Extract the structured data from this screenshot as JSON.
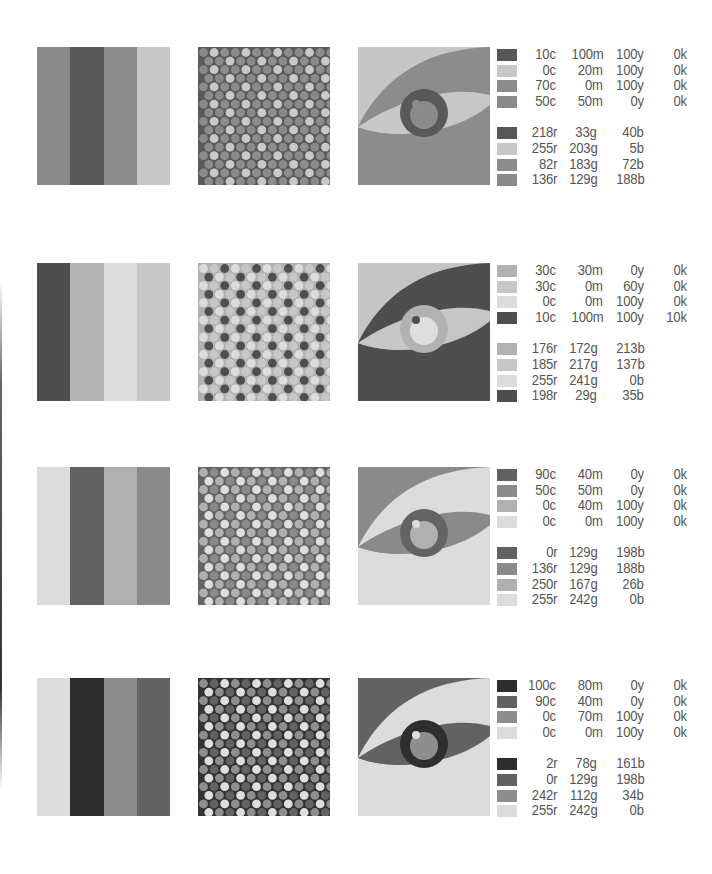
{
  "rows": [
    {
      "top": 47,
      "stripes": [
        "#8a8a8a",
        "#575757",
        "#8c8c8c",
        "#c8c8c8"
      ],
      "dots": {
        "bg": "#5a5a5a",
        "colors": [
          "#8a8a8a",
          "#c9c9c9",
          "#8d8d8d"
        ]
      },
      "eye": {
        "bg": "#c6c6c6",
        "lid": "#8c8c8c",
        "white": "#c8c8c8",
        "iris": "#595959",
        "pupil": "#8a8a8a",
        "highlight": "#8c8c8c"
      },
      "cmyk": [
        {
          "swatch": "#575757",
          "c": "10c",
          "m": "100m",
          "y": "100y",
          "k": "0k"
        },
        {
          "swatch": "#c8c8c8",
          "c": "0c",
          "m": "20m",
          "y": "100y",
          "k": "0k"
        },
        {
          "swatch": "#8c8c8c",
          "c": "70c",
          "m": "0m",
          "y": "100y",
          "k": "0k"
        },
        {
          "swatch": "#8a8a8a",
          "c": "50c",
          "m": "50m",
          "y": "0y",
          "k": "0k"
        }
      ],
      "rgb": [
        {
          "swatch": "#575757",
          "r": "218r",
          "g": "33g",
          "b": "40b"
        },
        {
          "swatch": "#c8c8c8",
          "r": "255r",
          "g": "203g",
          "b": "5b"
        },
        {
          "swatch": "#8c8c8c",
          "r": "82r",
          "g": "183g",
          "b": "72b"
        },
        {
          "swatch": "#8a8a8a",
          "r": "136r",
          "g": "129g",
          "b": "188b"
        }
      ]
    },
    {
      "top": 263,
      "stripes": [
        "#4e4e4e",
        "#b4b4b4",
        "#dcdcdc",
        "#c7c7c7"
      ],
      "dots": {
        "bg": "#b2b2b2",
        "colors": [
          "#dcdcdc",
          "#c7c7c7",
          "#4e4e4e"
        ]
      },
      "eye": {
        "bg": "#c5c5c5",
        "lid": "#4e4e4e",
        "white": "#c7c7c7",
        "iris": "#b2b2b2",
        "pupil": "#dedede",
        "highlight": "#4e4e4e"
      },
      "cmyk": [
        {
          "swatch": "#b2b2b2",
          "c": "30c",
          "m": "30m",
          "y": "0y",
          "k": "0k"
        },
        {
          "swatch": "#c7c7c7",
          "c": "30c",
          "m": "0m",
          "y": "60y",
          "k": "0k"
        },
        {
          "swatch": "#dcdcdc",
          "c": "0c",
          "m": "0m",
          "y": "100y",
          "k": "0k"
        },
        {
          "swatch": "#4e4e4e",
          "c": "10c",
          "m": "100m",
          "y": "100y",
          "k": "10k"
        }
      ],
      "rgb": [
        {
          "swatch": "#b2b2b2",
          "r": "176r",
          "g": "172g",
          "b": "213b"
        },
        {
          "swatch": "#c7c7c7",
          "r": "185r",
          "g": "217g",
          "b": "137b"
        },
        {
          "swatch": "#dcdcdc",
          "r": "255r",
          "g": "241g",
          "b": "0b"
        },
        {
          "swatch": "#4e4e4e",
          "r": "198r",
          "g": "29g",
          "b": "35b"
        }
      ]
    },
    {
      "top": 467,
      "stripes": [
        "#dcdcdc",
        "#626262",
        "#b0b0b0",
        "#8a8a8a"
      ],
      "dots": {
        "bg": "#646464",
        "colors": [
          "#b0b0b0",
          "#8a8a8a",
          "#dedede"
        ]
      },
      "eye": {
        "bg": "#8a8a8a",
        "lid": "#dcdcdc",
        "white": "#8a8a8a",
        "iris": "#636363",
        "pupil": "#b0b0b0",
        "highlight": "#dedede"
      },
      "cmyk": [
        {
          "swatch": "#626262",
          "c": "90c",
          "m": "40m",
          "y": "0y",
          "k": "0k"
        },
        {
          "swatch": "#8a8a8a",
          "c": "50c",
          "m": "50m",
          "y": "0y",
          "k": "0k"
        },
        {
          "swatch": "#b0b0b0",
          "c": "0c",
          "m": "40m",
          "y": "100y",
          "k": "0k"
        },
        {
          "swatch": "#dcdcdc",
          "c": "0c",
          "m": "0m",
          "y": "100y",
          "k": "0k"
        }
      ],
      "rgb": [
        {
          "swatch": "#626262",
          "r": "0r",
          "g": "129g",
          "b": "198b"
        },
        {
          "swatch": "#8a8a8a",
          "r": "136r",
          "g": "129g",
          "b": "188b"
        },
        {
          "swatch": "#b0b0b0",
          "r": "250r",
          "g": "167g",
          "b": "26b"
        },
        {
          "swatch": "#dcdcdc",
          "r": "255r",
          "g": "242g",
          "b": "0b"
        }
      ]
    },
    {
      "top": 678,
      "stripes": [
        "#dcdcdc",
        "#2e2e2e",
        "#8e8e8e",
        "#626262"
      ],
      "dots": {
        "bg": "#333333",
        "colors": [
          "#8e8e8e",
          "#626262",
          "#dedede"
        ]
      },
      "eye": {
        "bg": "#626262",
        "lid": "#dcdcdc",
        "white": "#626262",
        "iris": "#2e2e2e",
        "pupil": "#8e8e8e",
        "highlight": "#dedede"
      },
      "cmyk": [
        {
          "swatch": "#2e2e2e",
          "c": "100c",
          "m": "80m",
          "y": "0y",
          "k": "0k"
        },
        {
          "swatch": "#626262",
          "c": "90c",
          "m": "40m",
          "y": "0y",
          "k": "0k"
        },
        {
          "swatch": "#8e8e8e",
          "c": "0c",
          "m": "70m",
          "y": "100y",
          "k": "0k"
        },
        {
          "swatch": "#dcdcdc",
          "c": "0c",
          "m": "0m",
          "y": "100y",
          "k": "0k"
        }
      ],
      "rgb": [
        {
          "swatch": "#2e2e2e",
          "r": "2r",
          "g": "78g",
          "b": "161b"
        },
        {
          "swatch": "#626262",
          "r": "0r",
          "g": "129g",
          "b": "198b"
        },
        {
          "swatch": "#8e8e8e",
          "r": "242r",
          "g": "112g",
          "b": "34b"
        },
        {
          "swatch": "#dcdcdc",
          "r": "255r",
          "g": "242g",
          "b": "0b"
        }
      ]
    }
  ]
}
